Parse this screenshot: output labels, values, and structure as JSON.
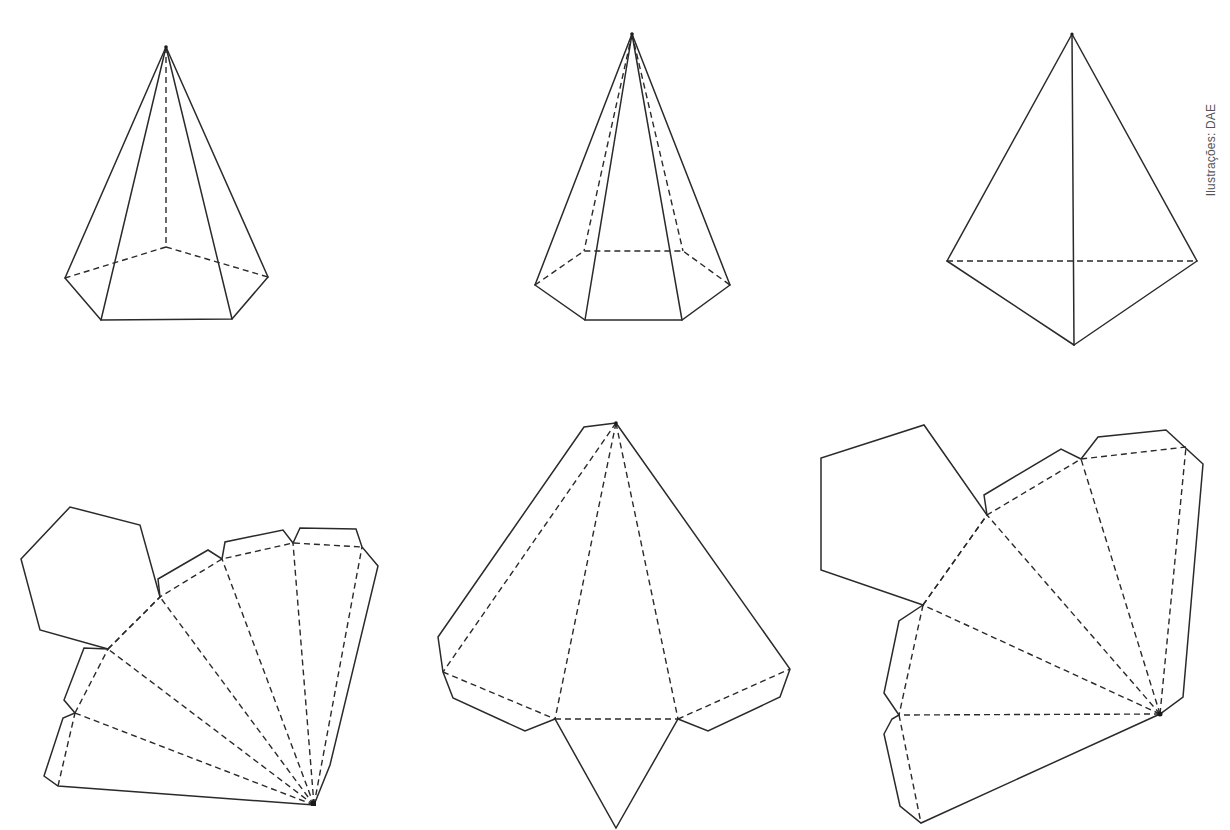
{
  "credit": {
    "text": "Ilustrações: DAE"
  },
  "style": {
    "line_color": "#2a2a2a",
    "background": "#ffffff",
    "credit_color": "#555555"
  },
  "figures": {
    "solids": [
      {
        "id": "pentagonal-pyramid",
        "kind": "solid",
        "base_sides": 5
      },
      {
        "id": "hexagonal-pyramid",
        "kind": "solid",
        "base_sides": 6
      },
      {
        "id": "triangular-pyramid",
        "kind": "solid",
        "base_sides": 3
      }
    ],
    "nets": [
      {
        "id": "hexagonal-pyramid-net",
        "kind": "net",
        "base_sides": 6,
        "lateral_faces": 6
      },
      {
        "id": "triangular-pyramid-net",
        "kind": "net",
        "base_sides": 3,
        "lateral_faces": 3
      },
      {
        "id": "pentagonal-pyramid-net",
        "kind": "net",
        "base_sides": 5,
        "lateral_faces": 5
      }
    ]
  }
}
